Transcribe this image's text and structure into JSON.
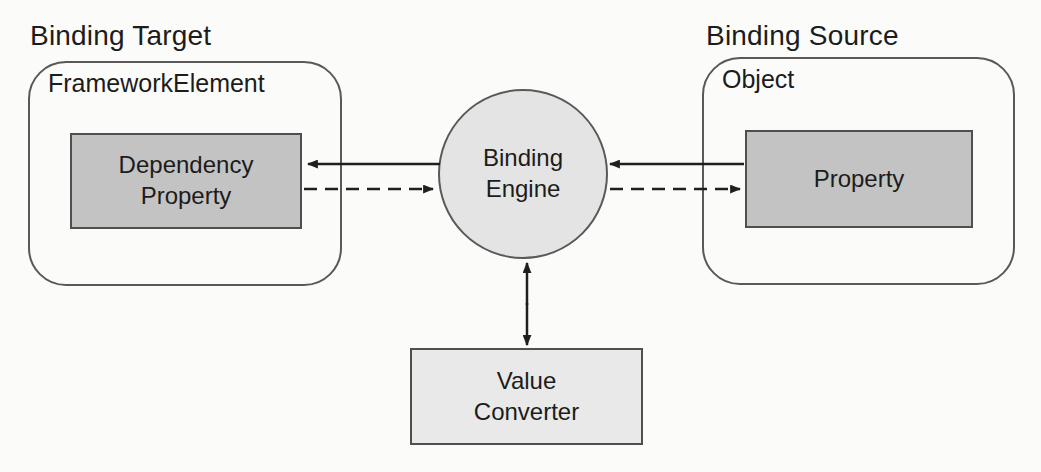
{
  "diagram": {
    "binding_target": {
      "heading": "Binding Target",
      "container_label": "FrameworkElement",
      "box_label": "Dependency\nProperty"
    },
    "binding_source": {
      "heading": "Binding Source",
      "container_label": "Object",
      "box_label": "Property"
    },
    "binding_engine": {
      "label": "Binding\nEngine"
    },
    "value_converter": {
      "label": "Value\nConverter"
    },
    "connections": [
      {
        "from": "Binding Engine",
        "to": "Dependency Property",
        "style": "solid",
        "description": "solid arrow pointing left into Dependency Property"
      },
      {
        "from": "Dependency Property",
        "to": "Binding Engine",
        "style": "dashed",
        "description": "dashed arrow pointing right into Binding Engine"
      },
      {
        "from": "Property",
        "to": "Binding Engine",
        "style": "solid",
        "description": "solid arrow pointing left into Binding Engine"
      },
      {
        "from": "Binding Engine",
        "to": "Property",
        "style": "dashed",
        "description": "dashed arrow pointing right into Property"
      },
      {
        "from": "Binding Engine",
        "to": "Value Converter",
        "style": "solid-double-headed",
        "description": "vertical double-headed arrow"
      }
    ],
    "colors": {
      "background": "#fbfbfa",
      "text": "#1c1c1c",
      "line": "#1f1f1f",
      "border": "#595959",
      "box_border": "#4f4f4f",
      "inner_box_fill": "#c3c3c3",
      "engine_fill": "#e4e4e4",
      "converter_fill": "#e9e9e9"
    }
  }
}
